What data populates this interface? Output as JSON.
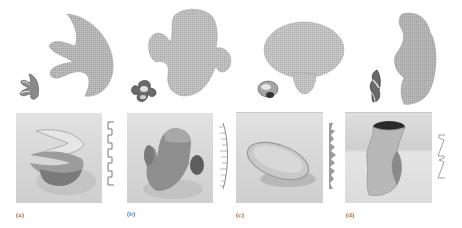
{
  "figure": {
    "panels": [
      {
        "label": "(a)",
        "shape": "spiral-fork surface",
        "profile": "square-wave"
      },
      {
        "label": "(b)",
        "shape": "saddle with ears",
        "profile": "comb"
      },
      {
        "label": "(c)",
        "shape": "bowl dish",
        "profile": "spiky"
      },
      {
        "label": "(d)",
        "shape": "twisted vase",
        "profile": "zigzag"
      }
    ]
  },
  "colors": {
    "mesh": "#a8a8a8",
    "photo_bg": "#d8d8d8",
    "object_dark": "#6e6e6e",
    "label": "#333333"
  }
}
